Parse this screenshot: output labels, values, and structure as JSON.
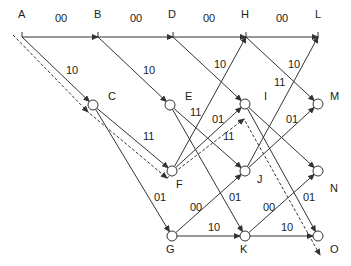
{
  "diagram": {
    "type": "trellis",
    "colors": {
      "line": "#333333",
      "node_fill": "#ffffff",
      "background": "#ffffff"
    },
    "nodes": [
      {
        "id": "A",
        "x": 22,
        "y": 37,
        "label": "A",
        "lx": 18,
        "ly": 18,
        "circle": false
      },
      {
        "id": "B",
        "x": 98,
        "y": 37,
        "label": "B",
        "lx": 94,
        "ly": 18,
        "circle": false
      },
      {
        "id": "D",
        "x": 173,
        "y": 37,
        "label": "D",
        "lx": 168,
        "ly": 18,
        "circle": false
      },
      {
        "id": "H",
        "x": 246,
        "y": 37,
        "label": "H",
        "lx": 241,
        "ly": 18,
        "circle": false
      },
      {
        "id": "L",
        "x": 318,
        "y": 37,
        "label": "L",
        "lx": 315,
        "ly": 18,
        "circle": false
      },
      {
        "id": "C",
        "x": 93,
        "y": 105,
        "label": "C",
        "lx": 108,
        "ly": 100,
        "circle": true
      },
      {
        "id": "E",
        "x": 170,
        "y": 105,
        "label": "E",
        "lx": 185,
        "ly": 100,
        "circle": true
      },
      {
        "id": "I",
        "x": 245,
        "y": 104,
        "label": "I",
        "lx": 264,
        "ly": 100,
        "circle": true
      },
      {
        "id": "M",
        "x": 318,
        "y": 104,
        "label": "M",
        "lx": 330,
        "ly": 100,
        "circle": true
      },
      {
        "id": "F",
        "x": 172,
        "y": 171,
        "label": "F",
        "lx": 176,
        "ly": 188,
        "circle": true
      },
      {
        "id": "J",
        "x": 245,
        "y": 171,
        "label": "J",
        "lx": 257,
        "ly": 183,
        "circle": true
      },
      {
        "id": "N",
        "x": 318,
        "y": 171,
        "label": "N",
        "lx": 330,
        "ly": 192,
        "circle": true
      },
      {
        "id": "G",
        "x": 172,
        "y": 236,
        "label": "G",
        "lx": 166,
        "ly": 253,
        "circle": true
      },
      {
        "id": "K",
        "x": 245,
        "y": 236,
        "label": "K",
        "lx": 240,
        "ly": 253,
        "circle": true
      },
      {
        "id": "O",
        "x": 318,
        "y": 236,
        "label": "O",
        "lx": 330,
        "ly": 253,
        "circle": true
      }
    ],
    "edges": [
      {
        "from": "A",
        "to": "B",
        "label": "00",
        "lx": 55,
        "ly": 22
      },
      {
        "from": "B",
        "to": "D",
        "label": "00",
        "lx": 130,
        "ly": 22
      },
      {
        "from": "D",
        "to": "H",
        "label": "00",
        "lx": 203,
        "ly": 22
      },
      {
        "from": "H",
        "to": "L",
        "label": "00",
        "lx": 276,
        "ly": 22
      },
      {
        "from": "A",
        "to": "C",
        "label": "10",
        "lx": 66,
        "ly": 74
      },
      {
        "from": "B",
        "to": "E",
        "label": "10",
        "lx": 143,
        "ly": 74
      },
      {
        "from": "D",
        "to": "I",
        "label": "10",
        "lx": 214,
        "ly": 68
      },
      {
        "from": "H",
        "to": "M",
        "label": "10",
        "lx": 288,
        "ly": 68
      },
      {
        "from": "C",
        "to": "F",
        "label": "11",
        "lx": 143,
        "ly": 140
      },
      {
        "from": "C",
        "to": "G",
        "label": "01",
        "lx": 154,
        "ly": 201
      },
      {
        "from": "E",
        "to": "J",
        "label": "11",
        "lx": 190,
        "ly": 116
      },
      {
        "from": "E",
        "to": "K",
        "label": "01",
        "lx": 229,
        "ly": 201
      },
      {
        "from": "F",
        "to": "H",
        "label": "",
        "lx": 0,
        "ly": 0
      },
      {
        "from": "F",
        "to": "I",
        "label": "01",
        "lx": 212,
        "ly": 123
      },
      {
        "from": "G",
        "to": "J",
        "label": "00",
        "lx": 190,
        "ly": 211
      },
      {
        "from": "G",
        "to": "K",
        "label": "10",
        "lx": 208,
        "ly": 231
      },
      {
        "from": "I",
        "to": "N",
        "label": "11",
        "lx": 223,
        "ly": 140
      },
      {
        "from": "I",
        "to": "O",
        "label": "01",
        "lx": 303,
        "ly": 201
      },
      {
        "from": "J",
        "to": "L",
        "label": "11",
        "lx": 274,
        "ly": 86
      },
      {
        "from": "J",
        "to": "M",
        "label": "01",
        "lx": 286,
        "ly": 123
      },
      {
        "from": "K",
        "to": "N",
        "label": "00",
        "lx": 263,
        "ly": 211
      },
      {
        "from": "K",
        "to": "O",
        "label": "10",
        "lx": 281,
        "ly": 231
      }
    ],
    "path_dashed": {
      "points": "13,35 88,112 167,178 244,119 320,255"
    }
  }
}
